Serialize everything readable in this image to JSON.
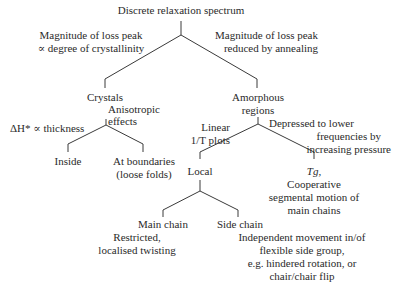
{
  "diagram": {
    "root": "Discrete relaxation spectrum",
    "edge_left_label": [
      "Magnitude of loss peak",
      "∝ degree of crystallinity"
    ],
    "edge_right_label": [
      "Magnitude of loss peak",
      "reduced by annealing"
    ],
    "crystals": {
      "label": "Crystals",
      "annotation": [
        "Anisotropic",
        "effects"
      ],
      "edge_label_prefix": "ΔH* ∝ thickness",
      "children": {
        "inside": "Inside",
        "boundaries": [
          "At boundaries",
          "(loose folds)"
        ]
      }
    },
    "amorphous": {
      "label": [
        "Amorphous",
        "regions"
      ],
      "edge_left_label": [
        "Linear",
        "1/T plots"
      ],
      "edge_right_label": [
        "Depressed to lower",
        "frequencies by",
        "increasing pressure"
      ],
      "local": {
        "label": "Local",
        "main_chain": {
          "label": "Main chain",
          "desc": [
            "Restricted,",
            "localised twisting"
          ]
        },
        "side_chain": {
          "label": "Side chain",
          "desc": [
            "Independent movement in/of",
            "flexible side group,",
            "e.g. hindered rotation, or",
            "chair/chair flip"
          ]
        }
      },
      "tg": {
        "label": "Tg,",
        "desc": [
          "Cooperative",
          "segmental motion of",
          "main chains"
        ]
      }
    }
  },
  "colors": {
    "line": "#3a3a3a",
    "text": "#2a2a2a",
    "background": "#ffffff"
  }
}
